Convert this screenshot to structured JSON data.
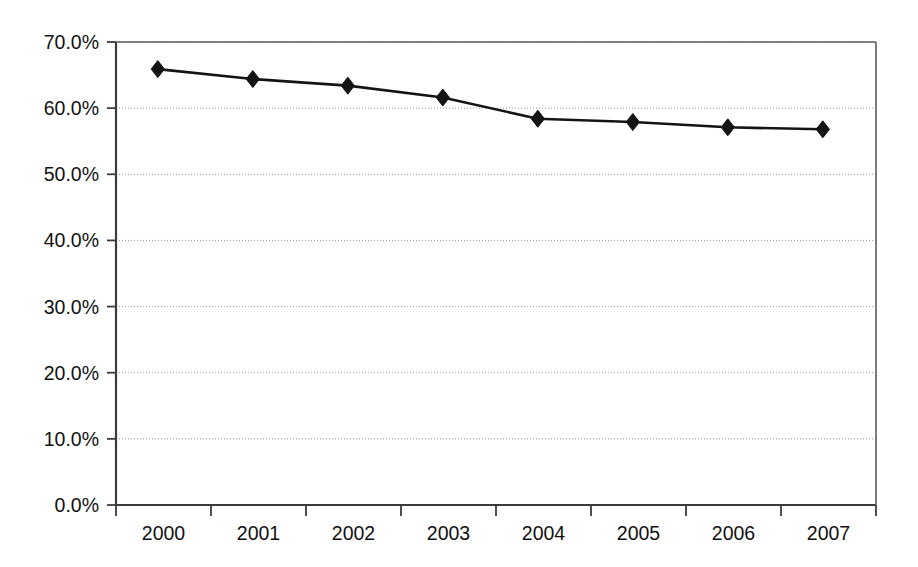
{
  "chart_data": {
    "type": "line",
    "title": "",
    "subtitle": "",
    "xlabel": "",
    "ylabel": "",
    "categories": [
      "2000",
      "2001",
      "2002",
      "2003",
      "2004",
      "2005",
      "2006",
      "2007"
    ],
    "x": [
      2000,
      2001,
      2002,
      2003,
      2004,
      2005,
      2006,
      2007
    ],
    "ylim": [
      0.0,
      70.0
    ],
    "yticks": [
      0.0,
      10.0,
      20.0,
      30.0,
      40.0,
      50.0,
      60.0,
      70.0
    ],
    "ytick_labels": [
      "0.0%",
      "10.0%",
      "20.0%",
      "30.0%",
      "40.0%",
      "50.0%",
      "60.0%",
      "70.0%"
    ],
    "xtick_labels": [
      "2000",
      "2001",
      "2002",
      "2003",
      "2004",
      "2005",
      "2006",
      "2007"
    ],
    "grid": true,
    "grid_axis": "y",
    "legend_position": "center-left-upper",
    "value_suffix": "%",
    "series": [
      {
        "name": "Employment-based coverage",
        "marker": "diamond",
        "color": "#141414",
        "values": [
          65.9,
          64.4,
          63.4,
          61.6,
          58.4,
          57.9,
          57.1,
          56.8
        ],
        "labels": [
          "65.9%",
          "64.4%",
          "63.4%",
          "61.6%",
          "58.4%",
          "57.9%",
          "57.1%",
          "56.8%"
        ]
      },
      {
        "name": "Medicaid and SCHIP*",
        "marker": "square",
        "color": "#141414",
        "values": [
          20.9,
          22.7,
          23.9,
          26.4,
          27.0,
          26.7,
          27.1,
          28.1
        ],
        "labels": [
          "20.9%",
          "22.7%",
          "23.9%",
          "26.4%",
          "27.0%",
          "26.7%",
          "27.1%",
          "28.1%"
        ]
      },
      {
        "name": "Uninsured",
        "marker": "triangle",
        "color": "#141414",
        "values": [
          11.6,
          11.3,
          11.2,
          11.0,
          10.5,
          10.9,
          11.7,
          11.0
        ],
        "labels": [
          "11.6%",
          "11.3%",
          "11.2%",
          "11.0%",
          "10.5%",
          "10.9%",
          "11.7%",
          "11.0%"
        ]
      }
    ]
  },
  "legend": {
    "entries": [
      {
        "label": "Employment-based coverage",
        "marker": "diamond"
      },
      {
        "label": "Medicaid and SCHIP*",
        "marker": "square"
      },
      {
        "label": "Uninsured",
        "marker": "triangle"
      }
    ]
  }
}
